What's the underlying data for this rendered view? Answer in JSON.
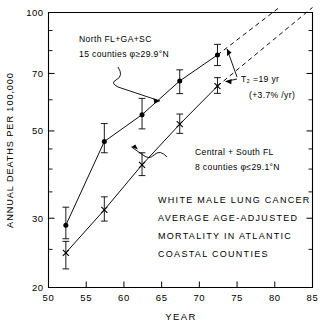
{
  "chart_data": {
    "type": "line",
    "title": "WHITE MALE LUNG CANCER AVERAGE AGE-ADJUSTED MORTALITY IN ATLANTIC COASTAL COUNTIES",
    "title_lines": [
      "WHITE MALE LUNG CANCER",
      "AVERAGE AGE-ADJUSTED",
      "MORTALITY IN ATLANTIC",
      "COASTAL COUNTIES"
    ],
    "xlabel": "YEAR",
    "ylabel": "ANNUAL DEATHS PER 100,000",
    "yscale": "log",
    "xlim": [
      50,
      85
    ],
    "ylim": [
      20,
      100
    ],
    "grid": false,
    "legend_position": "none",
    "xticks": [
      50,
      55,
      60,
      65,
      70,
      75,
      80,
      85
    ],
    "xtick_labels": [
      "50",
      "55",
      "60",
      "65",
      "70",
      "75",
      "80",
      "85"
    ],
    "yticks": [
      20,
      30,
      50,
      70,
      100
    ],
    "ytick_labels": [
      "20",
      "30",
      "50",
      "70",
      "100"
    ],
    "yminor_ticks": [
      25,
      35,
      40,
      45,
      60,
      80,
      90
    ],
    "series": [
      {
        "name": "North FL+GA+SC",
        "marker": "filled-circle",
        "x": [
          52.3,
          57.4,
          62.4,
          67.4,
          72.4
        ],
        "values": [
          28.8,
          47.0,
          55.0,
          67.0,
          78.0
        ],
        "err_low": [
          26.6,
          44.0,
          50.6,
          62.2,
          73.3
        ],
        "err_high": [
          32.0,
          52.2,
          60.5,
          71.5,
          83.0
        ],
        "extrapolation": {
          "style": "dashed",
          "x": [
            72.4,
            80.6
          ],
          "values": [
            78.0,
            103.0
          ]
        }
      },
      {
        "name": "Central + South FL",
        "marker": "x",
        "x": [
          52.3,
          57.4,
          62.4,
          67.4,
          72.4
        ],
        "values": [
          24.5,
          31.5,
          41.0,
          52.0,
          65.0
        ],
        "err_low": [
          22.3,
          29.5,
          38.5,
          49.3,
          62.3
        ],
        "err_high": [
          26.2,
          34.0,
          44.0,
          55.2,
          68.3
        ],
        "extrapolation": {
          "style": "dashed",
          "x": [
            72.4,
            85.0
          ],
          "values": [
            65.0,
            103.0
          ]
        }
      }
    ],
    "annotations": [
      {
        "id": "north-label-line1",
        "text": "North FL+GA+SC"
      },
      {
        "id": "north-label-line2",
        "text": "15 counties  φ≥29.9°N"
      },
      {
        "id": "south-label-line1",
        "text": "Central + South FL"
      },
      {
        "id": "south-label-line2",
        "text": "8 counties  φ≤29.1°N"
      },
      {
        "id": "doubling-time-line1",
        "text": "T₂ =19 yr"
      },
      {
        "id": "doubling-time-line2",
        "text": "(+3.7% /yr)"
      }
    ]
  },
  "annotations": {
    "north_line1": "North FL+GA+SC",
    "north_line2": "15 counties  φ≥29.9°N",
    "south_line1": "Central + South FL",
    "south_line2": "8 counties  φ≤29.1°N",
    "t2_line1": "T₂ =19 yr",
    "t2_line2": "(+3.7% /yr)"
  },
  "title_block": {
    "line1": "WHITE MALE LUNG CANCER",
    "line2": "AVERAGE AGE-ADJUSTED",
    "line3": "MORTALITY IN ATLANTIC",
    "line4": "COASTAL COUNTIES"
  },
  "axes": {
    "x_label": "YEAR",
    "y_label": "ANNUAL DEATHS PER 100,000",
    "x_ticks": [
      "50",
      "55",
      "60",
      "65",
      "70",
      "75",
      "80",
      "85"
    ],
    "y_ticks": [
      "100",
      "70",
      "50",
      "30",
      "20"
    ]
  },
  "colors": {
    "ink": "#000000",
    "background": "#ffffff"
  }
}
